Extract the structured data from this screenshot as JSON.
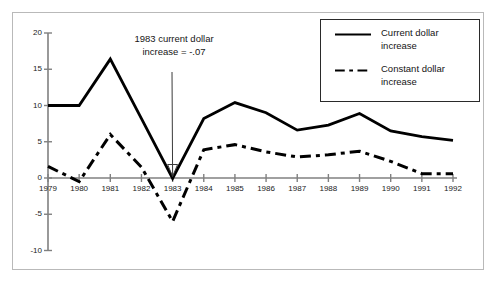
{
  "chart_data": {
    "type": "line",
    "title": "",
    "xlabel": "",
    "ylabel": "",
    "categories": [
      "1979",
      "1980",
      "1981",
      "1982",
      "1983",
      "1984",
      "1985",
      "1986",
      "1987",
      "1988",
      "1989",
      "1990",
      "1991",
      "1992"
    ],
    "x": [
      1979,
      1980,
      1981,
      1982,
      1983,
      1984,
      1985,
      1986,
      1987,
      1988,
      1989,
      1990,
      1991,
      1992
    ],
    "xlim": [
      1979,
      1992
    ],
    "ylim": [
      -10,
      20
    ],
    "yticks": [
      -10,
      -5,
      0,
      5,
      10,
      15,
      20
    ],
    "ytick_labels": [
      "-10",
      "-5",
      "0",
      "5",
      "10",
      "15",
      "20"
    ],
    "xtick_labels": [
      "1979",
      "1980",
      "1981",
      "1982",
      "1983",
      "1984",
      "1985",
      "1986",
      "1987",
      "1988",
      "1989",
      "1990",
      "1991",
      "1992"
    ],
    "grid": false,
    "legend_position": "top-right",
    "series": [
      {
        "name": "Current dollar increase",
        "style": "solid",
        "color": "#000000",
        "values": [
          10.0,
          10.0,
          16.4,
          8.2,
          -0.07,
          8.2,
          10.4,
          9.0,
          6.6,
          7.3,
          8.9,
          6.5,
          5.7,
          5.2
        ]
      },
      {
        "name": "Constant dollar increase",
        "style": "dashed",
        "color": "#000000",
        "values": [
          1.6,
          -0.5,
          6.0,
          1.5,
          -6.0,
          3.9,
          4.6,
          3.6,
          2.9,
          3.2,
          3.7,
          2.3,
          0.6,
          0.6
        ]
      }
    ],
    "annotations": [
      {
        "text_line1": "1983 current dollar",
        "text_line2": "increase = -.07",
        "points_to_year": 1983,
        "points_to_value": -0.07
      }
    ],
    "legend": [
      {
        "label_line1": "Current dollar",
        "label_line2": "increase",
        "style": "solid"
      },
      {
        "label_line1": "Constant dollar",
        "label_line2": "increase",
        "style": "dashed"
      }
    ]
  }
}
